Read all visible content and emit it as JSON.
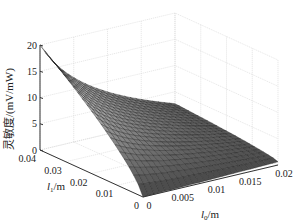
{
  "chart_data": {
    "type": "surface3d",
    "title": "",
    "x": {
      "label": "l0/m",
      "label_sub": "0",
      "label_base": "l",
      "label_unit": "/m",
      "range": [
        0,
        0.02
      ],
      "ticks": [
        0,
        0.005,
        0.01,
        0.015,
        0.02
      ],
      "tick_labels": [
        "0",
        "0.005",
        "0.01",
        "0.015",
        "0.02"
      ]
    },
    "y": {
      "label": "l1/m",
      "label_sub": "1",
      "label_base": "l",
      "label_unit": "/m",
      "range": [
        0,
        0.04
      ],
      "ticks": [
        0,
        0.01,
        0.02,
        0.03,
        0.04
      ],
      "tick_labels": [
        "0",
        "0.01",
        "0.02",
        "0.03",
        "0.04"
      ]
    },
    "z": {
      "label": "灵敏度/(mV/mW)",
      "range": [
        0,
        20
      ],
      "ticks": [
        0,
        5,
        10,
        15,
        20
      ],
      "tick_labels": [
        "0",
        "5",
        "10",
        "15",
        "20"
      ]
    },
    "grid": true,
    "colormap": "gray",
    "surface_samples": {
      "description": "approximate sensitivity values read from the surface",
      "points": [
        {
          "l0": 0,
          "l1": 0.04,
          "z": 20
        },
        {
          "l0": 0,
          "l1": 0.02,
          "z": 12
        },
        {
          "l0": 0,
          "l1": 0,
          "z": 0
        },
        {
          "l0": 0.01,
          "l1": 0.04,
          "z": 9
        },
        {
          "l0": 0.02,
          "l1": 0.04,
          "z": 6
        },
        {
          "l0": 0.02,
          "l1": 0,
          "z": 0.5
        }
      ]
    }
  }
}
